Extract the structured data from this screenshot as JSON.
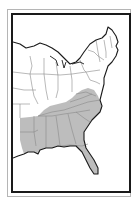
{
  "map": {
    "subject": "Eastern United States",
    "highlighted_region": "Southeastern states",
    "colors": {
      "highlight_fill": "#bdbdbd",
      "land_fill": "#ffffff",
      "state_border": "#8a8a8a",
      "coast_border": "#1a1a1a",
      "frame": "#1a1a1a",
      "outer_frame": "#b5b5b5"
    },
    "highlighted_states": [
      "Virginia",
      "North Carolina",
      "South Carolina",
      "Georgia",
      "Florida",
      "Alabama",
      "Mississippi",
      "Tennessee",
      "Kentucky",
      "Arkansas",
      "Louisiana"
    ]
  }
}
